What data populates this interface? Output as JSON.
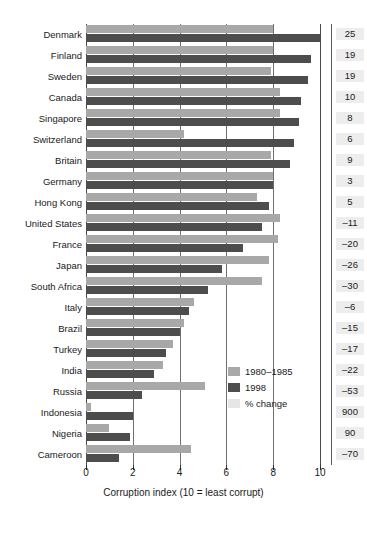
{
  "chart_data": {
    "type": "bar",
    "title": "",
    "subtitle": "",
    "xlabel": "Corruption index (10 = least corrupt)",
    "ylabel": "",
    "xlim": [
      0,
      10
    ],
    "xticks": [
      0,
      2,
      4,
      6,
      8,
      10
    ],
    "xticklabels": [
      "0",
      "2",
      "4",
      "6",
      "8",
      "10"
    ],
    "grid": true,
    "orientation": "horizontal",
    "legend_position": "inside-lower-right",
    "categories": [
      "Denmark",
      "Finland",
      "Sweden",
      "Canada",
      "Singapore",
      "Switzerland",
      "Britain",
      "Germany",
      "Hong Kong",
      "United States",
      "France",
      "Japan",
      "South Africa",
      "Italy",
      "Brazil",
      "Turkey",
      "India",
      "Russia",
      "Indonesia",
      "Nigeria",
      "Cameroon"
    ],
    "series": [
      {
        "name": "1980-1985",
        "color": "#a8a8a8",
        "values": [
          8.0,
          8.0,
          7.9,
          8.3,
          8.3,
          4.2,
          7.9,
          8.0,
          7.3,
          8.3,
          8.2,
          7.8,
          7.5,
          4.6,
          4.2,
          3.7,
          3.3,
          5.1,
          0.2,
          1.0,
          4.5
        ]
      },
      {
        "name": "1998",
        "color": "#4d4d4d",
        "values": [
          10.0,
          9.6,
          9.5,
          9.2,
          9.1,
          8.9,
          8.7,
          8.0,
          7.8,
          7.5,
          6.7,
          5.8,
          5.2,
          4.4,
          4.0,
          3.4,
          2.9,
          2.4,
          2.0,
          1.9,
          1.4
        ]
      }
    ],
    "pct_change_label": "% change",
    "pct_change": [
      "25",
      "19",
      "19",
      "10",
      "8",
      "6",
      "9",
      "3",
      "5",
      "–11",
      "–20",
      "–26",
      "–30",
      "–6",
      "–15",
      "–17",
      "–22",
      "–53",
      "900",
      "90",
      "–70"
    ]
  },
  "legend": {
    "items": [
      {
        "label": "1980–1985",
        "color": "#a8a8a8"
      },
      {
        "label": "1998",
        "color": "#4d4d4d"
      },
      {
        "label": "% change",
        "color": "#e6e6e6"
      }
    ]
  },
  "axis": {
    "title": "Corruption index (10 = least corrupt)",
    "ticks": [
      "0",
      "2",
      "4",
      "6",
      "8",
      "10"
    ]
  },
  "colors": {
    "early": "#a8a8a8",
    "late": "#4d4d4d",
    "pct_bg": "#ededed",
    "axis": "#5a5a5a",
    "background": "#ffffff"
  }
}
